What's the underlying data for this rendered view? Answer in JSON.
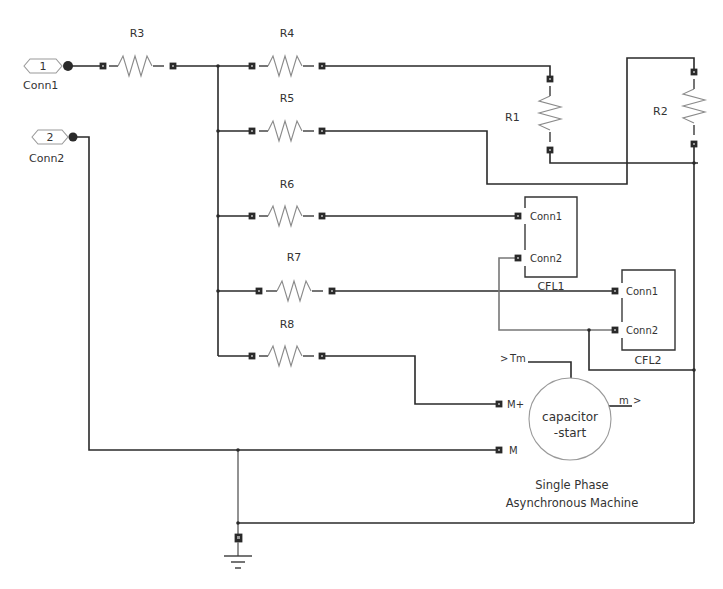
{
  "diagram": {
    "type": "electrical-schematic",
    "ports": [
      {
        "id": "conn1",
        "number": "1",
        "label": "Conn1"
      },
      {
        "id": "conn2",
        "number": "2",
        "label": "Conn2"
      }
    ],
    "resistors": [
      {
        "id": "R1",
        "label": "R1",
        "orientation": "vertical"
      },
      {
        "id": "R2",
        "label": "R2",
        "orientation": "vertical"
      },
      {
        "id": "R3",
        "label": "R3",
        "orientation": "horizontal"
      },
      {
        "id": "R4",
        "label": "R4",
        "orientation": "horizontal"
      },
      {
        "id": "R5",
        "label": "R5",
        "orientation": "horizontal"
      },
      {
        "id": "R6",
        "label": "R6",
        "orientation": "horizontal"
      },
      {
        "id": "R7",
        "label": "R7",
        "orientation": "horizontal"
      },
      {
        "id": "R8",
        "label": "R8",
        "orientation": "horizontal"
      }
    ],
    "cfl_blocks": [
      {
        "id": "CFL1",
        "label": "CFL1",
        "ports": [
          "Conn1",
          "Conn2"
        ]
      },
      {
        "id": "CFL2",
        "label": "CFL2",
        "ports": [
          "Conn1",
          "Conn2"
        ]
      }
    ],
    "machine": {
      "id": "motor",
      "inner_line1": "capacitor",
      "inner_line2": "-start",
      "title_line1": "Single Phase",
      "title_line2": "Asynchronous Machine",
      "input_tm": "Tm",
      "output_m": "m",
      "port_mplus": "M+",
      "port_m": "M"
    },
    "ground": {
      "id": "ground"
    }
  }
}
